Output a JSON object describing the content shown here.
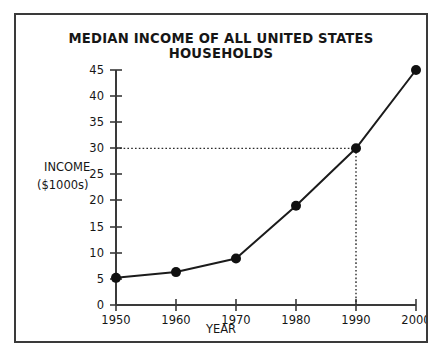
{
  "chart_data": {
    "type": "line",
    "title": "MEDIAN INCOME OF ALL UNITED STATES HOUSEHOLDS",
    "xlabel": "YEAR",
    "ylabel_lines": [
      "INCOME",
      "($1000s)"
    ],
    "ylabel": "INCOME ($1000s)",
    "x": [
      1950,
      1960,
      1970,
      1980,
      1990,
      2000
    ],
    "values": [
      5.2,
      6.3,
      8.9,
      19.0,
      30.0,
      45.0
    ],
    "categories": [
      "1950",
      "1960",
      "1970",
      "1980",
      "1990",
      "2000"
    ],
    "xticks": [
      "1950",
      "1960",
      "1970",
      "1980",
      "1990",
      "2000"
    ],
    "yticks": [
      "0",
      "5",
      "10",
      "15",
      "20",
      "25",
      "30",
      "35",
      "40",
      "45"
    ],
    "xlim": [
      1950,
      2000
    ],
    "ylim": [
      0,
      45
    ],
    "grid": false,
    "legend": null,
    "annotations": [
      {
        "name": "guide-1990-to-30",
        "description": "Dotted guide lines from 1990 on x-axis up to the point and across to 30 on y-axis",
        "x": 1990,
        "y": 30
      }
    ],
    "colors": {
      "line": "#1b1b1b",
      "marker": "#111111",
      "axis": "#3a3a3a",
      "border": "#3a3a3a",
      "background": "#ffffff",
      "text": "#161616"
    }
  }
}
